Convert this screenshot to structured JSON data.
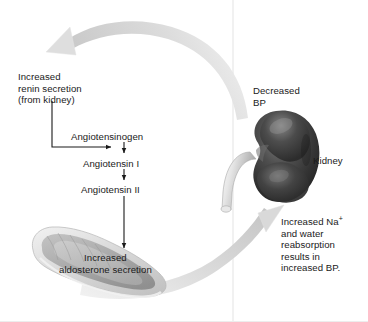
{
  "figure": {
    "background_color": "#ffffff",
    "text_color": "#1a1a1a",
    "arrow_color": "#d8d8d8",
    "kidney_color": "#3a3a3a",
    "adrenal_color": "#c9c9c9",
    "divider_color": "#e3e3e3"
  },
  "labels": {
    "renin": "Increased\nrenin secretion\n(from kidney)",
    "angiotensinogen": "Angiotensinogen",
    "angiotensin_1": "Angiotensin I",
    "angiotensin_2": "Angiotensin II",
    "aldosterone": "Increased\naldosterone secretion",
    "decreased_bp": "Decreased\nBP",
    "kidney": "Kidney",
    "sodium_water_prefix": "Increased Na",
    "sodium_superscript": "+",
    "sodium_water_rest": "\nand water\nreabsorption\nresults in\nincreased BP."
  },
  "illustrations": {
    "kidney": "kidney-illustration",
    "adrenal_gland": "adrenal-gland-illustration"
  },
  "arrows": {
    "feedback_top": "curved-arrow-kidney-to-renin",
    "feedback_bottom": "curved-arrow-adrenal-to-kidney",
    "renin_to_cascade": "elbow-arrow-renin-to-angiotensin",
    "agn_to_ang1": "arrow-angiotensinogen-to-angiotensin-1",
    "ang1_to_ang2": "arrow-angiotensin-1-to-angiotensin-2",
    "ang2_to_aldosterone": "arrow-angiotensin-2-to-aldosterone"
  }
}
